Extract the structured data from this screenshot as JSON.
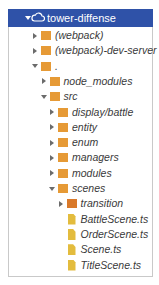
{
  "tree": {
    "root": {
      "label": "tower-diffense",
      "icon": "cloud-icon",
      "expanded": true,
      "header_bg": "#2f52a8"
    },
    "colors": {
      "folder": "#e69a36",
      "folder_orange": "#d9792a",
      "file": "#e3bc3e",
      "text": "#3a3a3a",
      "border": "#c9c9c9"
    },
    "items": [
      {
        "label": "(webpack)",
        "type": "folder",
        "expanded": false,
        "depth": 1
      },
      {
        "label": "(webpack)-dev-server",
        "type": "folder",
        "expanded": false,
        "depth": 1
      },
      {
        "label": ".",
        "type": "folder",
        "expanded": true,
        "depth": 1
      },
      {
        "label": "node_modules",
        "type": "folder",
        "expanded": false,
        "depth": 2
      },
      {
        "label": "src",
        "type": "folder",
        "expanded": true,
        "depth": 2
      },
      {
        "label": "display/battle",
        "type": "folder",
        "expanded": false,
        "depth": 3
      },
      {
        "label": "entity",
        "type": "folder",
        "expanded": false,
        "depth": 3
      },
      {
        "label": "enum",
        "type": "folder",
        "expanded": false,
        "depth": 3
      },
      {
        "label": "managers",
        "type": "folder",
        "expanded": false,
        "depth": 3
      },
      {
        "label": "modules",
        "type": "folder",
        "expanded": false,
        "depth": 3
      },
      {
        "label": "scenes",
        "type": "folder",
        "expanded": true,
        "depth": 3
      },
      {
        "label": "transition",
        "type": "folder",
        "expanded": false,
        "depth": 4
      },
      {
        "label": "BattleScene.ts",
        "type": "file",
        "depth": 4
      },
      {
        "label": "OrderScene.ts",
        "type": "file",
        "depth": 4
      },
      {
        "label": "Scene.ts",
        "type": "file",
        "depth": 4
      },
      {
        "label": "TitleScene.ts",
        "type": "file",
        "depth": 4
      }
    ]
  }
}
